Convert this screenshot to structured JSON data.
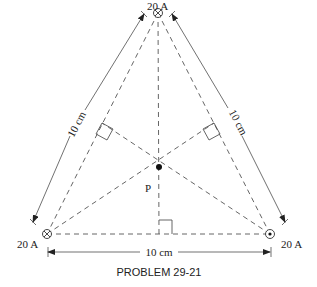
{
  "figure": {
    "caption": "PROBLEM 29-21",
    "point_label": "P",
    "wires": [
      {
        "position": "top",
        "current": "20 A",
        "direction": "into-page"
      },
      {
        "position": "bottom-left",
        "current": "20 A",
        "direction": "into-page"
      },
      {
        "position": "bottom-right",
        "current": "20 A",
        "direction": "out-of-page"
      }
    ],
    "sides": {
      "left": "10 cm",
      "right": "10 cm",
      "bottom": "10 cm"
    }
  }
}
